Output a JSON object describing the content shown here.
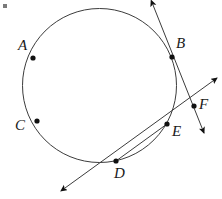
{
  "figure": {
    "name": "circle-with-secant-and-tangent-lines",
    "width": 222,
    "height": 199,
    "background": "#ffffff",
    "stroke_color": "#3c3c3c",
    "dot_color": "#111111",
    "label_color": "#1a1a1a",
    "stroke_width": 1,
    "dot_radius": 2.6
  },
  "circle": {
    "name": "main-circle",
    "cx": 99.5,
    "cy": 85.5,
    "r": 77
  },
  "points": [
    {
      "id": "A",
      "label": "A",
      "x": 33,
      "y": 58,
      "label_x": 18,
      "label_y": 38
    },
    {
      "id": "B",
      "label": "B",
      "x": 172,
      "y": 57,
      "label_x": 176,
      "label_y": 36
    },
    {
      "id": "C",
      "label": "C",
      "x": 37,
      "y": 121,
      "label_x": 15,
      "label_y": 118
    },
    {
      "id": "D",
      "label": "D",
      "x": 116,
      "y": 161,
      "label_x": 114,
      "label_y": 166
    },
    {
      "id": "E",
      "label": "E",
      "x": 167,
      "y": 124,
      "label_x": 172,
      "label_y": 124
    },
    {
      "id": "F",
      "label": "F",
      "x": 194,
      "y": 106,
      "label_x": 199,
      "label_y": 97
    }
  ],
  "lines": [
    {
      "id": "line-BF",
      "name": "tangent-line-through-B-and-F",
      "x1": 153,
      "y1": 5,
      "x2": 204,
      "y2": 133,
      "arrow_start": true,
      "arrow_end": true
    },
    {
      "id": "line-DEF",
      "name": "secant-line-through-D-E-and-F",
      "x1": 65,
      "y1": 188,
      "x2": 217,
      "y2": 78,
      "arrow_start": true,
      "arrow_end": true
    },
    {
      "id": "chord-DE",
      "name": "chord-from-D-to-E",
      "x1": 116,
      "y1": 161,
      "x2": 167,
      "y2": 124,
      "arrow_start": false,
      "arrow_end": false
    }
  ],
  "corner_artifact": {
    "name": "scan-artifact",
    "color": "#7a7a7a"
  }
}
